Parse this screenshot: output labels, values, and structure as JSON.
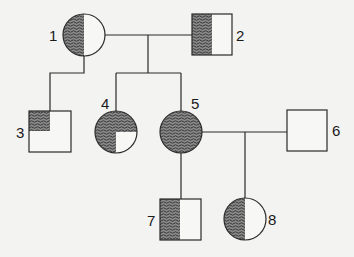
{
  "diagram": {
    "type": "pedigree",
    "colors": {
      "line": "#2a2a2a",
      "shade": "#5a5a5a",
      "fill": "#f7f7f5",
      "background": "#f3f3f1"
    },
    "individuals": [
      {
        "id": "1",
        "label": "1",
        "sex": "female",
        "shading": "left-half"
      },
      {
        "id": "2",
        "label": "2",
        "sex": "male",
        "shading": "left-half"
      },
      {
        "id": "3",
        "label": "3",
        "sex": "male",
        "shading": "top-left-quadrant"
      },
      {
        "id": "4",
        "label": "4",
        "sex": "female",
        "shading": "three-quarters-except-bottom-right"
      },
      {
        "id": "5",
        "label": "5",
        "sex": "female",
        "shading": "full"
      },
      {
        "id": "6",
        "label": "6",
        "sex": "male",
        "shading": "none"
      },
      {
        "id": "7",
        "label": "7",
        "sex": "male",
        "shading": "left-half"
      },
      {
        "id": "8",
        "label": "8",
        "sex": "female",
        "shading": "left-half"
      }
    ],
    "relationships": [
      {
        "partners": [
          "1",
          "2"
        ],
        "children": [
          "4",
          "5"
        ]
      },
      {
        "parent": "1",
        "children": [
          "3"
        ]
      },
      {
        "partners": [
          "5",
          "6"
        ],
        "children": [
          "8"
        ]
      },
      {
        "parent": "5",
        "children": [
          "7"
        ]
      }
    ]
  }
}
